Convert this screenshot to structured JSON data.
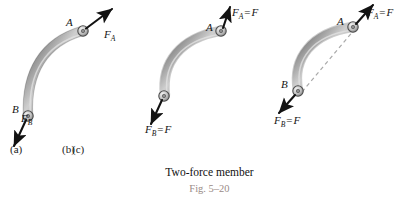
{
  "figure": {
    "caption_main": "Two-force member",
    "caption_fig": "Fig. 5–20",
    "caption_fig_color": "#9a8b86",
    "member_color_light": "#bdbdbd",
    "member_color_dark": "#6d6d6d",
    "arrow_color": "#121212",
    "dashed_line_color": "#a9a9a9",
    "background": "#ffffff"
  },
  "panels": [
    {
      "id": "a",
      "label": "(a)",
      "joint_a_label": "A",
      "joint_b_label": "B",
      "force_a_label": "F",
      "force_a_sub": "A",
      "force_a_equals": "",
      "force_a_value": "",
      "force_b_label": "F",
      "force_b_sub": "B",
      "force_b_equals": "",
      "force_b_value": "",
      "has_dashed_line": false
    },
    {
      "id": "b",
      "label": "(b)",
      "joint_a_label": "A",
      "joint_b_label": "",
      "force_a_label": "F",
      "force_a_sub": "A",
      "force_a_equals": "=",
      "force_a_value": "F",
      "force_b_label": "F",
      "force_b_sub": "B",
      "force_b_equals": "=",
      "force_b_value": "F",
      "has_dashed_line": false
    },
    {
      "id": "c",
      "label": "(c)",
      "joint_a_label": "A",
      "joint_b_label": "B",
      "force_a_label": "F",
      "force_a_sub": "A",
      "force_a_equals": "=",
      "force_a_value": "F",
      "force_b_label": "F",
      "force_b_sub": "B",
      "force_b_equals": "=",
      "force_b_value": "F",
      "has_dashed_line": true
    }
  ]
}
